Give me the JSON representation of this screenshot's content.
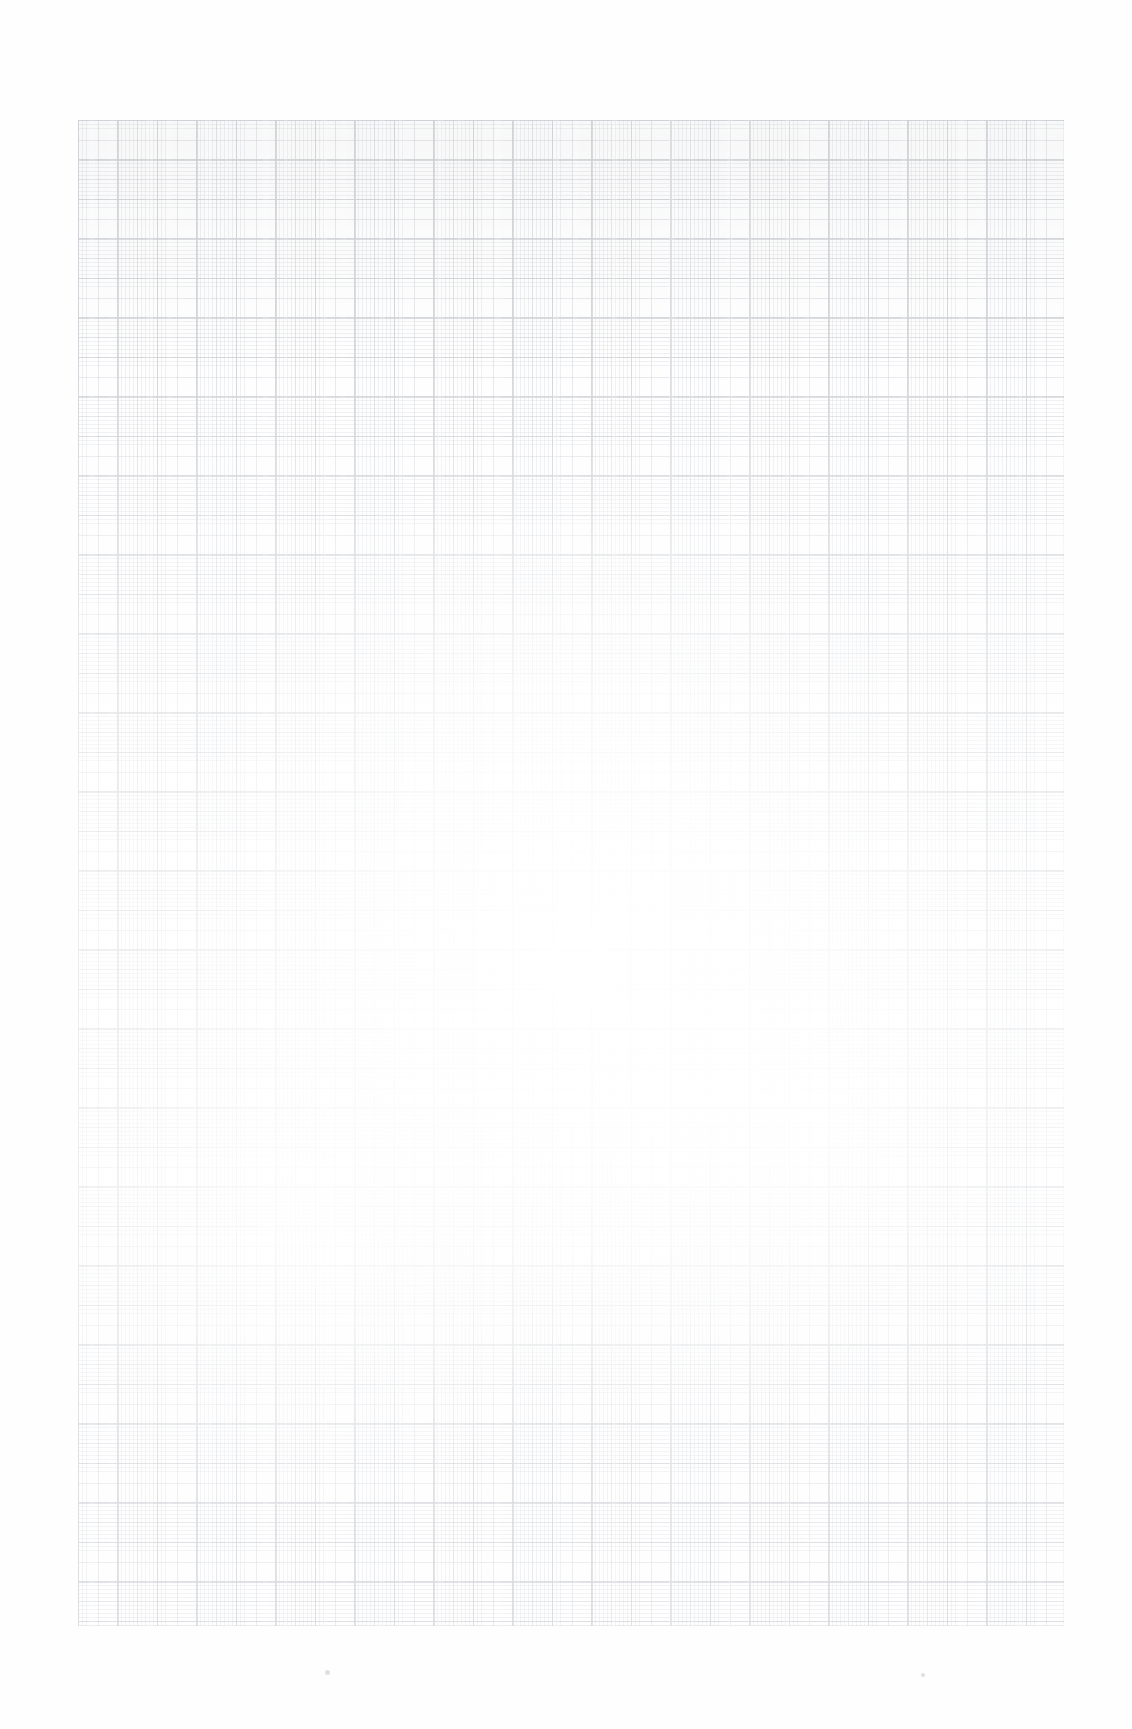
{
  "document": {
    "kind": "scanned-graph-paper",
    "title": "",
    "visible_text": "",
    "description": "Scanned sheet of blank millimetre graph paper, heavily faded"
  },
  "page": {
    "width": 1132,
    "height": 1729,
    "background_color": "#ffffff",
    "paper_color": "#fefefe"
  },
  "grid": {
    "left": 78,
    "top": 120,
    "width": 986,
    "height": 1506,
    "fine_spacing_px": 3.95,
    "medium_spacing_px": 19.75,
    "major_spacing_px": 39.5,
    "fine_color": "#767e8c",
    "medium_color": "#646c7c",
    "major_color": "#565e6e",
    "border_color": "#606878",
    "ink_opacity": 0.3
  },
  "artifacts": {
    "specks": [
      {
        "left": 325,
        "top": 1670,
        "size": 5
      },
      {
        "left": 921,
        "top": 1673,
        "size": 4
      }
    ]
  }
}
